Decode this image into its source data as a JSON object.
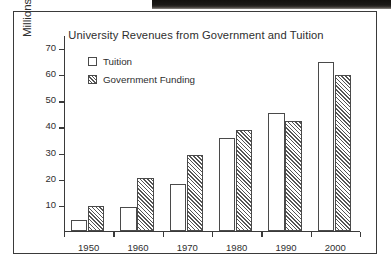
{
  "chart_data": {
    "type": "bar",
    "title": "University Revenues from Government and Tuition",
    "xlabel": "",
    "ylabel": "Millions of Dollars",
    "categories": [
      "1950",
      "1960",
      "1970",
      "1980",
      "1990",
      "2000"
    ],
    "series": [
      {
        "name": "Tuition",
        "values": [
          4,
          9,
          18,
          35.5,
          45,
          64.5
        ]
      },
      {
        "name": "Government Funding",
        "values": [
          9.5,
          20,
          29,
          38.5,
          42,
          59.5
        ]
      }
    ],
    "ylim": [
      0,
      75
    ],
    "yticks": [
      10,
      20,
      30,
      40,
      50,
      60,
      70
    ],
    "grid": false,
    "legend_position": "top-left",
    "legend": [
      {
        "label": "Tuition",
        "swatch": "empty"
      },
      {
        "label": "Government Funding",
        "swatch": "hatched"
      }
    ],
    "colors": {
      "bar_outline": "#4a4a4a",
      "tuition_fill": "#ffffff",
      "government_hatch": "#555555",
      "axis": "#3a3a3a",
      "text": "#2e2e2e",
      "frame": "#3a3a3a",
      "background": "#ffffff"
    }
  }
}
